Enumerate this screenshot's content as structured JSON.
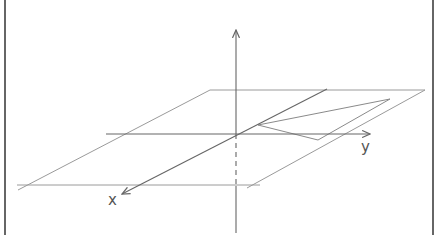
{
  "diagram": {
    "type": "3d-coordinate-system",
    "axes": {
      "x_label": "x",
      "y_label": "y",
      "z_label": ""
    },
    "colors": {
      "frame": "#333333",
      "axis": "#666666",
      "plane": "#9a9a9a",
      "triangle": "#8a8a8a",
      "label": "#555555"
    }
  }
}
